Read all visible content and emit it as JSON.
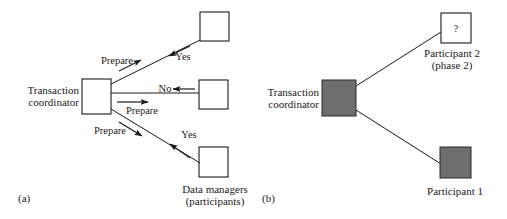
{
  "figure": {
    "caption_a": "(a)",
    "caption_b": "(b)",
    "colors": {
      "stroke": "#1a1a1a",
      "box_fill_empty": "#ffffff",
      "box_fill_shaded": "#6e6e6e",
      "text": "#1a1a1a",
      "background": "#ffffff"
    }
  },
  "panel_a": {
    "coordinator": {
      "label_line1": "Transaction",
      "label_line2": "coordinator",
      "fill": "empty"
    },
    "participants_label_line1": "Data managers",
    "participants_label_line2": "(participants)",
    "nodes": [
      {
        "id": "dm-top",
        "fill": "empty"
      },
      {
        "id": "dm-middle",
        "fill": "empty"
      },
      {
        "id": "dm-bottom",
        "fill": "empty"
      }
    ],
    "edges": [
      {
        "id": "top-prepare",
        "label": "Prepare",
        "direction": "coordinator-to-participant"
      },
      {
        "id": "top-yes",
        "label": "Yes",
        "direction": "participant-to-coordinator"
      },
      {
        "id": "middle-prepare",
        "label": "Prepare",
        "direction": "coordinator-to-participant"
      },
      {
        "id": "middle-no",
        "label": "No",
        "direction": "participant-to-coordinator"
      },
      {
        "id": "bottom-prepare",
        "label": "Prepare",
        "direction": "coordinator-to-participant"
      },
      {
        "id": "bottom-yes",
        "label": "Yes",
        "direction": "participant-to-coordinator"
      }
    ]
  },
  "panel_b": {
    "coordinator": {
      "label_line1": "Transaction",
      "label_line2": "coordinator",
      "fill": "shaded"
    },
    "participant_2": {
      "label_line1": "Participant 2",
      "label_line2": "(phase 2)",
      "box_text": "?",
      "fill": "empty"
    },
    "participant_1": {
      "label_line1": "Participant 1",
      "fill": "shaded"
    }
  }
}
